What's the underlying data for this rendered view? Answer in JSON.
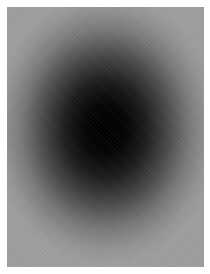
{
  "image": {
    "description": "Blurred radial gradient: dark black center fading to mid gray at edges, on a white margin",
    "colors": {
      "margin": "#ffffff",
      "edge_gray": "#9e9e9e",
      "center_black": "#000000"
    }
  }
}
